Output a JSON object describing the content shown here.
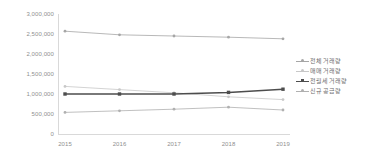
{
  "chart_data": {
    "type": "line",
    "title": "",
    "subtitle": "",
    "xlabel": "",
    "ylabel": "",
    "categories": [
      "2015",
      "2016",
      "2017",
      "2018",
      "2019"
    ],
    "x": [
      2015,
      2016,
      2017,
      2018,
      2019
    ],
    "ylim": [
      0,
      3000000
    ],
    "xlim": [
      "2015",
      "2019"
    ],
    "y_ticks": [
      3000000,
      2500000,
      2000000,
      1500000,
      1000000,
      500000,
      0
    ],
    "y_tick_labels": [
      "3,000,000",
      "2,500,000",
      "2,000,000",
      "1,500,000",
      "1,000,000",
      "500,000",
      "0"
    ],
    "x_tick_labels": [
      "2015",
      "2016",
      "2017",
      "2018",
      "2019"
    ],
    "grid": false,
    "legend_position": "right",
    "series": [
      {
        "name": "전체 거래량",
        "color": "#a6a6a6",
        "marker": "circle",
        "values": [
          2570000,
          2480000,
          2450000,
          2420000,
          2380000
        ]
      },
      {
        "name": "매매 거래량",
        "color": "#c8c8c8",
        "marker": "circle",
        "values": [
          1190000,
          1110000,
          1030000,
          930000,
          860000
        ]
      },
      {
        "name": "전월세 거래량",
        "color": "#4d4d4d",
        "marker": "square",
        "values": [
          1000000,
          1000000,
          1000000,
          1040000,
          1120000
        ]
      },
      {
        "name": "신규 공급량",
        "color": "#b0b0b0",
        "marker": "circle",
        "values": [
          540000,
          580000,
          620000,
          670000,
          600000
        ]
      }
    ]
  },
  "legend": {
    "items": [
      {
        "label": "전체 거래량"
      },
      {
        "label": "매매 거래량"
      },
      {
        "label": "전월세 거래량"
      },
      {
        "label": "신규 공급량"
      }
    ]
  }
}
